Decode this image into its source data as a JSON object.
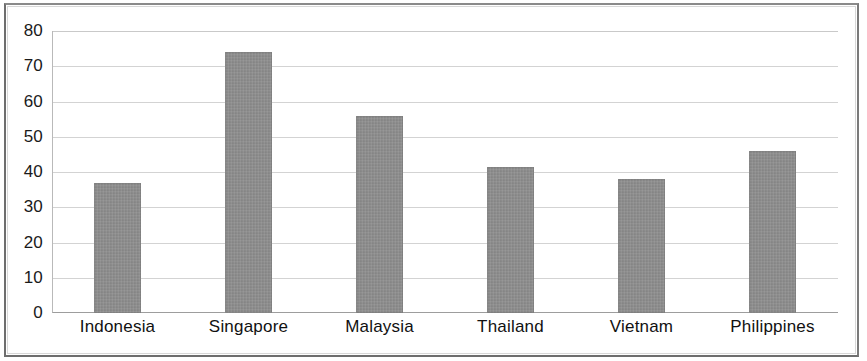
{
  "chart_data": {
    "type": "bar",
    "title": "",
    "subtitle": "",
    "xlabel": "",
    "ylabel": "",
    "categories": [
      "Indonesia",
      "Singapore",
      "Malaysia",
      "Thailand",
      "Vietnam",
      "Philippines"
    ],
    "values": [
      37,
      74,
      56,
      41.5,
      38,
      46
    ],
    "ylim": [
      0,
      80
    ],
    "yticks": [
      80,
      70,
      60,
      50,
      40,
      30,
      20,
      10,
      0
    ],
    "ytick_labels": [
      "80",
      "70",
      "60",
      "50",
      "40",
      "30",
      "20",
      "10",
      "0"
    ],
    "grid": true,
    "grid_axis": "y",
    "legend": null,
    "series": [
      {
        "name": "",
        "color": "#8b8b8b",
        "values": [
          37,
          74,
          56,
          41.5,
          38,
          46
        ]
      }
    ],
    "annotations": []
  },
  "figure": {
    "background_color": "#ffffff",
    "border_color": "#6e6e6e",
    "gridline_color": "#d3d3d3",
    "axis_color": "#9d9d9d",
    "bar_color": "#8b8b8b",
    "text_color": "#111111"
  }
}
